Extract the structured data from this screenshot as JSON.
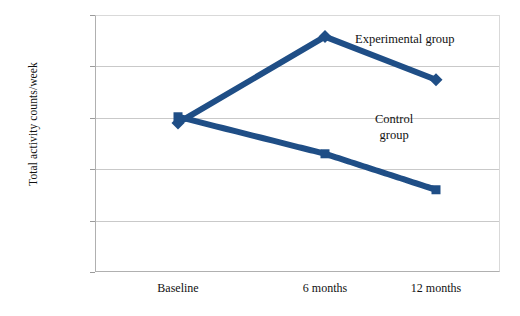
{
  "chart_data": {
    "type": "line",
    "title": "",
    "subtitle": "",
    "xlabel": "",
    "ylabel": "Total activity counts/week",
    "categories": [
      "Baseline",
      "6 months",
      "12 months"
    ],
    "x_positions_px": [
      178,
      325,
      436
    ],
    "ylim": [
      1500000,
      4000000
    ],
    "ytick_step": 500000,
    "yticks": [
      "4000000",
      "3500000",
      "3000000",
      "2500000",
      "2000000",
      "1500000"
    ],
    "ytick_values": [
      4000000,
      3500000,
      3000000,
      2500000,
      2000000,
      1500000
    ],
    "grid": true,
    "grid_axis": "y",
    "legend": "inline-annotations",
    "series": [
      {
        "name": "Experimental group",
        "values": [
          2950000,
          3790000,
          3370000
        ],
        "style": "solid",
        "color": "#1F4E86",
        "width": 6,
        "marker": "diamond"
      },
      {
        "name": "Control group",
        "values": [
          3010000,
          2650000,
          2300000
        ],
        "style": "dashed",
        "color": "#1F4E86",
        "width": 6,
        "marker": "square"
      }
    ],
    "annotations": [
      {
        "text": "Experimental group",
        "series": "Experimental group"
      },
      {
        "text": "Control\ngroup",
        "series": "Control group"
      }
    ],
    "colors": {
      "series": "#1F4E86",
      "gridline": "#C9C9C9",
      "axis": "#B0B0B0",
      "text": "#111111",
      "background": "#FFFFFF"
    }
  }
}
